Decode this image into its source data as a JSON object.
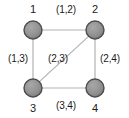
{
  "figure": {
    "type": "undirected-graph",
    "width": 129,
    "height": 118,
    "background": "#ffffff"
  },
  "style": {
    "node_fill": "#8c8c8c",
    "node_stroke": "#4d4d4d",
    "node_highlight": "#a6a6a6",
    "node_radius": 9,
    "edge_color": "#b3b3b3",
    "edge_width": 1.2,
    "label_color": "#1a1a1a"
  },
  "nodes": [
    {
      "id": "1",
      "label": "1",
      "cx": 33,
      "cy": 30,
      "label_x": 33,
      "label_y": 9
    },
    {
      "id": "2",
      "label": "2",
      "cx": 95,
      "cy": 30,
      "label_x": 95,
      "label_y": 9
    },
    {
      "id": "3",
      "label": "3",
      "cx": 33,
      "cy": 88,
      "label_x": 33,
      "label_y": 108
    },
    {
      "id": "4",
      "label": "4",
      "cx": 95,
      "cy": 88,
      "label_x": 95,
      "label_y": 108
    }
  ],
  "edges": [
    {
      "id": "e12",
      "from": "1",
      "to": "2",
      "label": "(1,2)",
      "label_x": 66,
      "label_y": 10,
      "x1": 42,
      "y1": 30,
      "x2": 86,
      "y2": 30
    },
    {
      "id": "e13",
      "from": "1",
      "to": "3",
      "label": "(1,3)",
      "label_x": 18,
      "label_y": 59,
      "x1": 33,
      "y1": 39,
      "x2": 33,
      "y2": 79
    },
    {
      "id": "e23",
      "from": "2",
      "to": "3",
      "label": "(2,3)",
      "label_x": 58,
      "label_y": 59,
      "x1": 88.6,
      "y1": 36.4,
      "x2": 39.4,
      "y2": 81.6
    },
    {
      "id": "e24",
      "from": "2",
      "to": "4",
      "label": "(2,4)",
      "label_x": 110,
      "label_y": 59,
      "x1": 95,
      "y1": 39,
      "x2": 95,
      "y2": 79
    },
    {
      "id": "e34",
      "from": "3",
      "to": "4",
      "label": "(3,4)",
      "label_x": 66,
      "label_y": 106,
      "x1": 42,
      "y1": 88,
      "x2": 86,
      "y2": 88
    }
  ]
}
